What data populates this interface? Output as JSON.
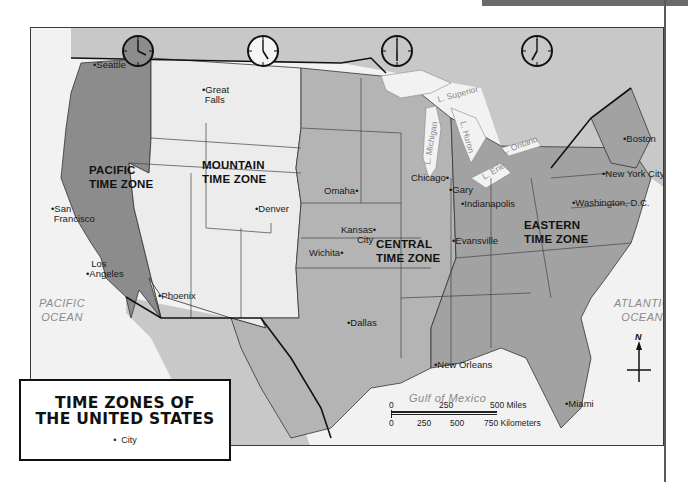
{
  "title": {
    "line1": "TIME ZONES OF",
    "line2": "THE UNITED STATES"
  },
  "legend": {
    "bullet": "•",
    "key_label": "City"
  },
  "zones": [
    {
      "id": "pacific",
      "line1": "PACIFIC",
      "line2": "TIME ZONE",
      "clock_time": "4:00",
      "shade": "#8c8c8c"
    },
    {
      "id": "mountain",
      "line1": "MOUNTAIN",
      "line2": "TIME ZONE",
      "clock_time": "5:00",
      "shade": "#ececec"
    },
    {
      "id": "central",
      "line1": "CENTRAL",
      "line2": "TIME ZONE",
      "clock_time": "6:00",
      "shade": "#b4b4b4"
    },
    {
      "id": "eastern",
      "line1": "EASTERN",
      "line2": "TIME ZONE",
      "clock_time": "7:00",
      "shade": "#a2a2a2"
    }
  ],
  "cities": [
    {
      "name": "Seattle"
    },
    {
      "name": "Great Falls",
      "line1": "Great",
      "line2": "Falls"
    },
    {
      "name": "San Francisco",
      "line1": "San",
      "line2": "Francisco"
    },
    {
      "name": "Los Angeles",
      "line1": "Los",
      "line2": "Angeles"
    },
    {
      "name": "Phoenix"
    },
    {
      "name": "Denver"
    },
    {
      "name": "Omaha"
    },
    {
      "name": "Kansas City",
      "line1": "Kansas",
      "line2": "City"
    },
    {
      "name": "Wichita"
    },
    {
      "name": "Dallas"
    },
    {
      "name": "Chicago"
    },
    {
      "name": "Gary"
    },
    {
      "name": "Indianapolis"
    },
    {
      "name": "Evansville"
    },
    {
      "name": "New Orleans"
    },
    {
      "name": "Boston"
    },
    {
      "name": "New York City"
    },
    {
      "name": "Washington, D.C."
    },
    {
      "name": "Miami"
    }
  ],
  "water": {
    "pacific": {
      "line1": "PACIFIC",
      "line2": "OCEAN"
    },
    "atlantic": {
      "line1": "ATLANTIC",
      "line2": "OCEAN"
    },
    "gulf": "Gulf of Mexico",
    "lakes": [
      "L. Superior",
      "L. Michigan",
      "L. Huron",
      "L. Erie",
      "L. Ontario"
    ]
  },
  "scale_bar": {
    "miles": [
      "0",
      "250",
      "500 Miles"
    ],
    "kilometers": [
      "0",
      "250",
      "500",
      "750 Kilometers"
    ]
  },
  "compass": {
    "north_label": "N"
  },
  "colors": {
    "pacific": "#8c8c8c",
    "mountain": "#ececec",
    "central": "#b4b4b4",
    "eastern": "#a2a2a2",
    "canada_mexico": "#c8c8c8",
    "water": "#f2f2f2",
    "border": "#1a1a1a"
  }
}
